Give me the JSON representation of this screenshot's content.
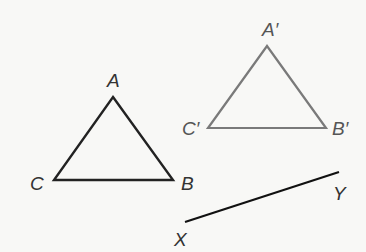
{
  "diagram": {
    "type": "geometry-figure",
    "colors": {
      "original": "#222222",
      "image": "#7a7a7a",
      "segment": "#111111",
      "label": "#333333"
    },
    "triangle_original": {
      "vertices": {
        "A": {
          "label": "A",
          "x": 113,
          "y": 97
        },
        "B": {
          "label": "B",
          "x": 173,
          "y": 180
        },
        "C": {
          "label": "C",
          "x": 54,
          "y": 180
        }
      }
    },
    "triangle_image": {
      "vertices": {
        "A": {
          "label": "A′",
          "x": 267,
          "y": 46
        },
        "B": {
          "label": "B′",
          "x": 326,
          "y": 128
        },
        "C": {
          "label": "C′",
          "x": 208,
          "y": 128
        }
      }
    },
    "segment": {
      "X": {
        "label": "X",
        "x": 185,
        "y": 222
      },
      "Y": {
        "label": "Y",
        "x": 339,
        "y": 172
      }
    }
  }
}
